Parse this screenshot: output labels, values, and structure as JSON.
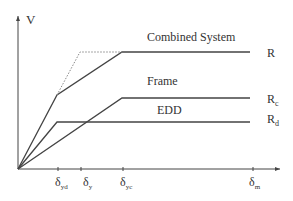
{
  "diagram": {
    "type": "force-displacement curves",
    "y_axis_label": "V",
    "curves": [
      {
        "name": "Combined System",
        "end_label": "R"
      },
      {
        "name": "Frame",
        "end_label": "Rc"
      },
      {
        "name": "EDD",
        "end_label": "Rd"
      }
    ],
    "x_ticks": [
      {
        "label": "δ",
        "sub": "yd"
      },
      {
        "label": "δ",
        "sub": "y"
      },
      {
        "label": "δ",
        "sub": "yc"
      },
      {
        "label": "δ",
        "sub": "m"
      }
    ],
    "colors": {
      "line": "#444444",
      "dotted": "#777777",
      "text": "#333333"
    }
  }
}
